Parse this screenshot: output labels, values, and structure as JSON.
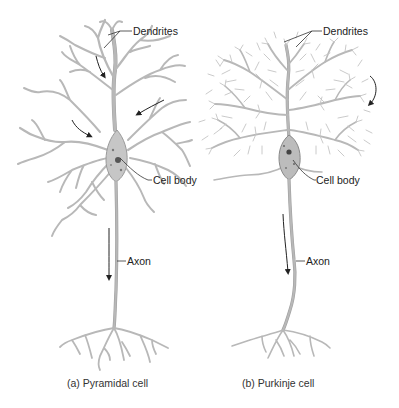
{
  "diagram": {
    "panels": [
      {
        "id": "pyramidal",
        "caption": "(a) Pyramidal cell",
        "labels": {
          "dendrites": "Dendrites",
          "cell_body": "Cell body",
          "axon": "Axon"
        }
      },
      {
        "id": "purkinje",
        "caption": "(b) Purkinje cell",
        "labels": {
          "dendrites": "Dendrites",
          "cell_body": "Cell body",
          "axon": "Axon"
        }
      }
    ],
    "colors": {
      "neuron_fill": "#c8c8c8",
      "neuron_outline": "#9a9a9a",
      "nucleus": "#555555",
      "label_text": "#222222"
    }
  }
}
